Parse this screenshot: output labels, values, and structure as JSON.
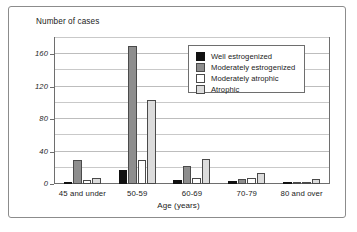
{
  "chart_data": {
    "type": "bar",
    "title": "Number of cases",
    "xlabel": "Age (years)",
    "ylabel": "",
    "categories": [
      "45 and under",
      "50-59",
      "60-69",
      "70-79",
      "80 and over"
    ],
    "series": [
      {
        "name": "Well estrogenized",
        "color": "#111111",
        "values": [
          3,
          17,
          5,
          4,
          3
        ]
      },
      {
        "name": "Moderately estrogenized",
        "color": "#8e8e8e",
        "values": [
          29,
          170,
          22,
          6,
          3
        ]
      },
      {
        "name": "Moderately atrophic",
        "color": "#ffffff",
        "values": [
          5,
          29,
          8,
          8,
          2
        ]
      },
      {
        "name": "Atrophic",
        "color": "#dcdcdc",
        "values": [
          8,
          104,
          31,
          13,
          6
        ]
      }
    ],
    "ylim": [
      0,
      180
    ],
    "ytick_labels": [
      "0",
      "40",
      "80",
      "120",
      "160"
    ],
    "ytick_values": [
      0,
      40,
      80,
      120,
      160
    ],
    "minor_gridline_values": [
      20,
      60,
      100,
      140,
      180
    ],
    "grid": true,
    "legend_position": "upper-right"
  }
}
